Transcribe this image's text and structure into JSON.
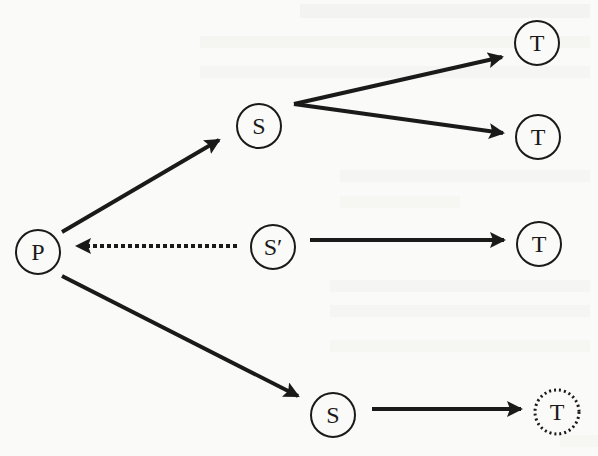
{
  "diagram": {
    "type": "directed-graph",
    "nodes": [
      {
        "id": "P",
        "label": "P",
        "x": 38,
        "y": 252,
        "style": "solid"
      },
      {
        "id": "S1",
        "label": "S",
        "x": 259,
        "y": 126,
        "style": "solid"
      },
      {
        "id": "S2",
        "label": "S′",
        "x": 273,
        "y": 247,
        "style": "solid"
      },
      {
        "id": "S3",
        "label": "S",
        "x": 333,
        "y": 415,
        "style": "solid"
      },
      {
        "id": "T1",
        "label": "T",
        "x": 537,
        "y": 43,
        "style": "solid"
      },
      {
        "id": "T2",
        "label": "T",
        "x": 538,
        "y": 137,
        "style": "solid"
      },
      {
        "id": "T3",
        "label": "T",
        "x": 539,
        "y": 244,
        "style": "solid"
      },
      {
        "id": "T4",
        "label": "T",
        "x": 557,
        "y": 412,
        "style": "dotted"
      }
    ],
    "edges": [
      {
        "from": "P",
        "to": "S1",
        "style": "solid"
      },
      {
        "from": "S1",
        "to": "T1",
        "style": "solid"
      },
      {
        "from": "S1",
        "to": "T2",
        "style": "solid"
      },
      {
        "from": "S2",
        "to": "P",
        "style": "dotted"
      },
      {
        "from": "S2",
        "to": "T3",
        "style": "solid"
      },
      {
        "from": "P",
        "to": "S3",
        "style": "solid"
      },
      {
        "from": "S3",
        "to": "T4",
        "style": "solid"
      }
    ],
    "colors": {
      "stroke": "#1a1a1a",
      "background": "#fafaf8"
    }
  }
}
